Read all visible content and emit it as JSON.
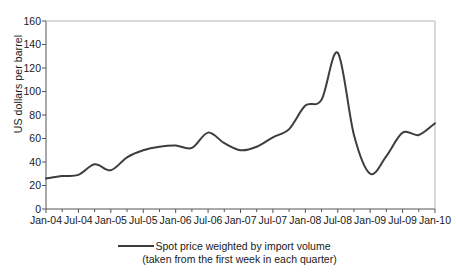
{
  "chart_data": {
    "type": "line",
    "title": "",
    "xlabel": "",
    "ylabel": "US dollars per barrel",
    "ylim": [
      0,
      160
    ],
    "yticks": [
      0,
      20,
      40,
      60,
      80,
      100,
      120,
      140,
      160
    ],
    "grid": false,
    "legend_position": "bottom",
    "legend": [
      "Spot price weighted by import volume",
      "(taken from the first week in each quarter)"
    ],
    "categories": [
      "Jan-04",
      "Apr-04",
      "Jul-04",
      "Oct-04",
      "Jan-05",
      "Apr-05",
      "Jul-05",
      "Oct-05",
      "Jan-06",
      "Apr-06",
      "Jul-06",
      "Oct-06",
      "Jan-07",
      "Apr-07",
      "Jul-07",
      "Oct-07",
      "Jan-08",
      "Apr-08",
      "Jul-08",
      "Oct-08",
      "Jan-09",
      "Apr-09",
      "Jul-09",
      "Oct-09",
      "Jan-10"
    ],
    "xtick_labels": [
      "Jan-04",
      "Jul-04",
      "Jan-05",
      "Jul-05",
      "Jan-06",
      "Jul-06",
      "Jan-07",
      "Jul-07",
      "Jan-08",
      "Jul-08",
      "Jan-09",
      "Jul-09",
      "Jan-10"
    ],
    "series": [
      {
        "name": "Spot price weighted by import volume",
        "color": "#3d3d3d",
        "values": [
          26,
          28,
          29,
          38,
          33,
          44,
          50,
          53,
          54,
          52,
          65,
          56,
          50,
          53,
          61,
          68,
          88,
          93,
          133,
          63,
          30,
          45,
          65,
          63,
          73
        ]
      }
    ]
  },
  "colors": {
    "line": "#3d3d3d",
    "axis": "#555555",
    "text": "#1a1a1a",
    "background": "#ffffff"
  }
}
